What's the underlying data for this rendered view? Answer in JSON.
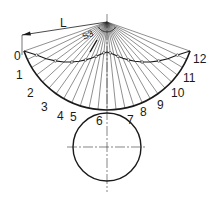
{
  "diagram": {
    "apex": {
      "x": 107,
      "y": 22
    },
    "arc_radius": 88,
    "arc_start_deg": 160.7,
    "arc_end_deg": 19.3,
    "division_count": 12,
    "division_labels": [
      "0",
      "1",
      "2",
      "3",
      "4",
      "5",
      "6",
      "7",
      "8",
      "9",
      "10",
      "11",
      "12"
    ],
    "dimension_label": "L",
    "section_label": "S3",
    "circle": {
      "cx": 107,
      "cy": 147,
      "r": 34
    },
    "stroke_color": "#1a1a1a",
    "thin_color": "#333333"
  }
}
